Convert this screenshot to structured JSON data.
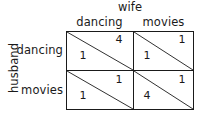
{
  "figure": {
    "type": "payoff-matrix",
    "rows": 2,
    "columns": 2
  },
  "column_player": {
    "name": "wife",
    "strategies": [
      "dancing",
      "movies"
    ]
  },
  "row_player": {
    "name": "husband",
    "strategies": [
      "dancing",
      "movies"
    ]
  },
  "cells": [
    {
      "row_strategy": "dancing",
      "column_strategy": "dancing",
      "row_payoff": "1",
      "column_payoff": "4"
    },
    {
      "row_strategy": "dancing",
      "column_strategy": "movies",
      "row_payoff": "1",
      "column_payoff": "1"
    },
    {
      "row_strategy": "movies",
      "column_strategy": "dancing",
      "row_payoff": "1",
      "column_payoff": "1"
    },
    {
      "row_strategy": "movies",
      "column_strategy": "movies",
      "row_payoff": "4",
      "column_payoff": "1"
    }
  ],
  "style": {
    "line_color": "#1a1a1a",
    "text_color": "#1a1a1a",
    "background": "#ffffff"
  }
}
